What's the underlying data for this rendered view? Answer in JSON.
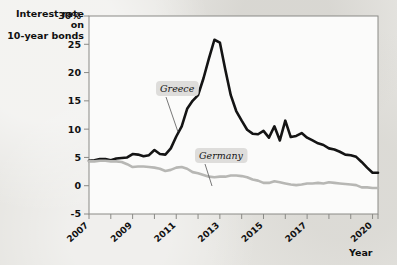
{
  "figure": {
    "background_color": "#e6e5e1",
    "plot_background_color": "#fbfbfa",
    "frame_color": "#8a8a86"
  },
  "axis_titles": {
    "y_line1": "Interest rate on",
    "y_line2": "10-year bonds",
    "x": "Year"
  },
  "chart_data": {
    "type": "line",
    "title": "",
    "subtitle": "",
    "xlabel": "Year",
    "ylabel": "Interest rate on 10-year bonds",
    "grid": false,
    "legend_position": "inline-annotations",
    "xlim": [
      2007,
      2020.25
    ],
    "ylim": [
      -5,
      30
    ],
    "yticks": [
      -5,
      0,
      5,
      10,
      15,
      20,
      25,
      30
    ],
    "ytick_labels": [
      "-5",
      "0",
      "5",
      "10",
      "15",
      "20",
      "25",
      "30%"
    ],
    "xticks": [
      2007,
      2008,
      2009,
      2010,
      2011,
      2012,
      2013,
      2014,
      2015,
      2016,
      2017,
      2018,
      2019,
      2020
    ],
    "xtick_labels_shown": [
      "2007",
      "2009",
      "2011",
      "2013",
      "2015",
      "2017",
      "2020"
    ],
    "xtick_label_values": [
      2007,
      2009,
      2011,
      2013,
      2015,
      2017,
      2020
    ],
    "x": [
      2007.0,
      2007.25,
      2007.5,
      2007.75,
      2008.0,
      2008.25,
      2008.5,
      2008.75,
      2009.0,
      2009.25,
      2009.5,
      2009.75,
      2010.0,
      2010.25,
      2010.5,
      2010.75,
      2011.0,
      2011.25,
      2011.5,
      2011.75,
      2012.0,
      2012.25,
      2012.5,
      2012.75,
      2013.0,
      2013.25,
      2013.5,
      2013.75,
      2014.0,
      2014.25,
      2014.5,
      2014.75,
      2015.0,
      2015.25,
      2015.5,
      2015.75,
      2016.0,
      2016.25,
      2016.5,
      2016.75,
      2017.0,
      2017.25,
      2017.5,
      2017.75,
      2018.0,
      2018.25,
      2018.5,
      2018.75,
      2019.0,
      2019.25,
      2019.5,
      2019.75,
      2020.0,
      2020.25
    ],
    "series": [
      {
        "name": "Greece",
        "color": "#141414",
        "width": 2.6,
        "label_x": 2010.1,
        "label_y": 21.0,
        "values": [
          4.4,
          4.5,
          4.7,
          4.7,
          4.5,
          4.8,
          4.9,
          5.0,
          5.6,
          5.5,
          5.2,
          5.4,
          6.3,
          5.6,
          5.5,
          6.6,
          8.7,
          10.5,
          13.6,
          15.0,
          16.0,
          19.0,
          22.5,
          25.8,
          25.3,
          20.5,
          16.0,
          13.2,
          11.5,
          9.9,
          9.2,
          9.1,
          9.7,
          8.5,
          10.5,
          8.0,
          11.5,
          8.6,
          8.8,
          9.3,
          8.5,
          8.0,
          7.5,
          7.2,
          6.6,
          6.4,
          6.0,
          5.5,
          5.4,
          5.1,
          4.2,
          3.2,
          2.3,
          2.3
        ]
      },
      {
        "name": "Germany",
        "color": "#b7b7b4",
        "width": 2.6,
        "label_x": 2011.8,
        "label_y": 7.2,
        "values": [
          4.3,
          4.3,
          4.4,
          4.4,
          4.3,
          4.3,
          4.2,
          3.8,
          3.3,
          3.4,
          3.4,
          3.3,
          3.2,
          3.0,
          2.6,
          2.8,
          3.2,
          3.3,
          3.0,
          2.4,
          2.2,
          1.9,
          1.6,
          1.5,
          1.6,
          1.6,
          1.8,
          1.8,
          1.7,
          1.5,
          1.1,
          0.9,
          0.5,
          0.5,
          0.8,
          0.6,
          0.4,
          0.2,
          0.1,
          0.2,
          0.4,
          0.4,
          0.5,
          0.4,
          0.6,
          0.5,
          0.4,
          0.3,
          0.2,
          0.1,
          -0.3,
          -0.3,
          -0.4,
          -0.4
        ]
      }
    ]
  }
}
